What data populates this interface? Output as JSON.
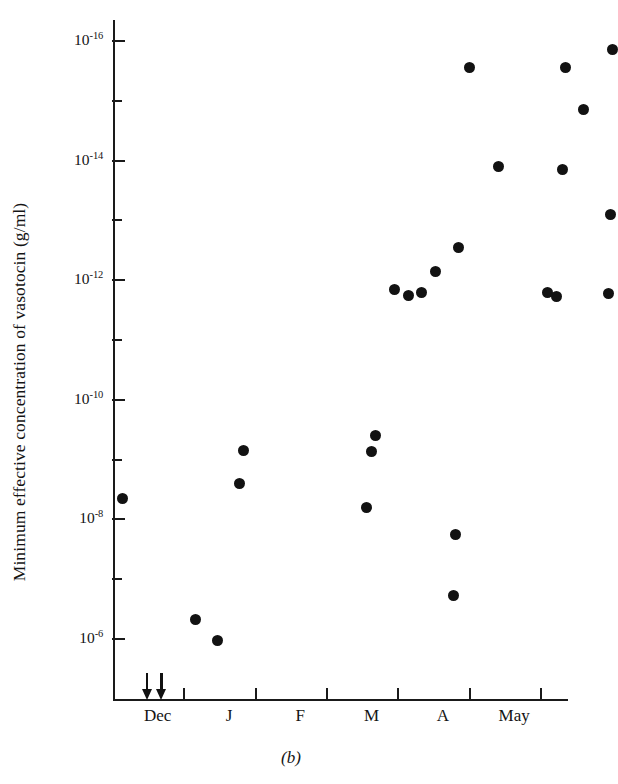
{
  "chart_data": {
    "type": "scatter",
    "title": "",
    "caption": "(b)",
    "ylabel": "Minimum effective concentration of vasotocin (g/ml)",
    "xlabel": "",
    "y_axis": {
      "scale": "log",
      "inverted": true,
      "note": "values increase downward; 10^-16 at top, 10^-6 at bottom",
      "ylim": [
        -16,
        -5.6
      ],
      "major_ticks": [
        {
          "exponent": -16,
          "mantissa": "10",
          "label": "10-16"
        },
        {
          "exponent": -14,
          "mantissa": "10",
          "label": "10-14"
        },
        {
          "exponent": -12,
          "mantissa": "10",
          "label": "10-12"
        },
        {
          "exponent": -10,
          "mantissa": "10",
          "label": "10-10"
        },
        {
          "exponent": -8,
          "mantissa": "10",
          "label": "10-8"
        },
        {
          "exponent": -6,
          "mantissa": "10",
          "label": "10-6"
        }
      ],
      "minor_tick_exponents": [
        -15,
        -13,
        -11,
        -9,
        -7
      ]
    },
    "x_axis": {
      "tick_label_mode": "between-ticks",
      "tick_positions_months": [
        0,
        1,
        2,
        3,
        4,
        5,
        6
      ],
      "categories": [
        "Dec",
        "J",
        "F",
        "M",
        "A",
        "May"
      ],
      "grid": false
    },
    "legend": {
      "show": false
    },
    "markers": {
      "shape": "circle",
      "color": "#121212",
      "size_px": 11
    },
    "annotations": [
      {
        "type": "arrow-down",
        "x_month": 0.47,
        "label": ""
      },
      {
        "type": "arrow-down",
        "x_month": 0.68,
        "label": ""
      }
    ],
    "points": [
      {
        "x_month": 0.13,
        "y_exponent": -8.35
      },
      {
        "x_month": 1.16,
        "y_exponent": -6.33
      },
      {
        "x_month": 1.46,
        "y_exponent": -5.98
      },
      {
        "x_month": 1.83,
        "y_exponent": -9.15
      },
      {
        "x_month": 1.78,
        "y_exponent": -8.6
      },
      {
        "x_month": 3.55,
        "y_exponent": -8.2
      },
      {
        "x_month": 3.62,
        "y_exponent": -9.13
      },
      {
        "x_month": 3.68,
        "y_exponent": -9.4
      },
      {
        "x_month": 3.95,
        "y_exponent": -11.85
      },
      {
        "x_month": 4.15,
        "y_exponent": -11.75
      },
      {
        "x_month": 4.33,
        "y_exponent": -11.8
      },
      {
        "x_month": 4.52,
        "y_exponent": -12.15
      },
      {
        "x_month": 4.85,
        "y_exponent": -12.55
      },
      {
        "x_month": 5.0,
        "y_exponent": -15.55
      },
      {
        "x_month": 4.8,
        "y_exponent": -7.75
      },
      {
        "x_month": 4.78,
        "y_exponent": -6.73
      },
      {
        "x_month": 5.4,
        "y_exponent": -13.9
      },
      {
        "x_month": 6.1,
        "y_exponent": -11.8
      },
      {
        "x_month": 6.22,
        "y_exponent": -11.72
      },
      {
        "x_month": 6.3,
        "y_exponent": -13.85
      },
      {
        "x_month": 6.35,
        "y_exponent": -15.55
      },
      {
        "x_month": 6.6,
        "y_exponent": -14.85
      },
      {
        "x_month": 6.95,
        "y_exponent": -11.78
      },
      {
        "x_month": 6.98,
        "y_exponent": -13.1
      },
      {
        "x_month": 7.0,
        "y_exponent": -15.85
      }
    ]
  }
}
